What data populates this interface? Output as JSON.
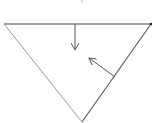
{
  "diagram": {
    "background": "#ffffff",
    "triangle": {
      "vertices": [
        [
          4,
          24
        ],
        [
          151,
          24
        ],
        [
          82,
          122
        ]
      ],
      "edges": [
        {
          "name": "top-edge",
          "from": [
            4,
            24
          ],
          "to": [
            151,
            24
          ],
          "color": "#444444",
          "width": 1.2
        },
        {
          "name": "left-edge",
          "from": [
            4,
            24
          ],
          "to": [
            82,
            122
          ],
          "color": "#9a9a9a",
          "width": 1
        },
        {
          "name": "right-edge",
          "from": [
            151,
            24
          ],
          "to": [
            82,
            122
          ],
          "color": "#555555",
          "width": 1.1
        }
      ]
    },
    "arrows": [
      {
        "name": "downward-arrow",
        "from": [
          75,
          24
        ],
        "to": [
          75,
          50
        ],
        "color": "#555555"
      },
      {
        "name": "inward-normal-arrow",
        "from": [
          115,
          77
        ],
        "to": [
          89,
          58
        ],
        "color": "#555555"
      }
    ],
    "marks": [
      {
        "name": "top-tick-mark",
        "at": [
          82,
          2
        ],
        "color": "#bbbbbb"
      }
    ],
    "vertex_dot": {
      "at": [
        151,
        24
      ],
      "color": "#222222"
    }
  }
}
